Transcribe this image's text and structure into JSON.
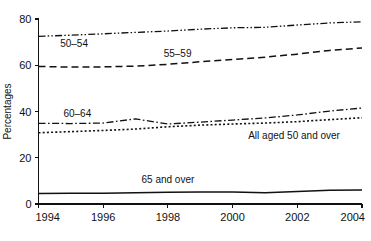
{
  "chart_data": {
    "type": "line",
    "title": "",
    "subtitle": "",
    "xlabel": "",
    "ylabel": "Percentages",
    "xlim": [
      1994,
      2004
    ],
    "ylim": [
      0,
      80
    ],
    "grid": false,
    "legend_position": "inline-labels",
    "x": [
      1994,
      1995,
      1996,
      1997,
      1998,
      1999,
      2000,
      2001,
      2002,
      2003,
      2004
    ],
    "xticks": [
      "1994",
      "1996",
      "1998",
      "2000",
      "2002",
      "2004"
    ],
    "xtick_values": [
      1994,
      1996,
      1998,
      2000,
      2002,
      2004
    ],
    "yticks": [
      "0",
      "20",
      "40",
      "60",
      "80"
    ],
    "ytick_values": [
      0,
      20,
      40,
      60,
      80
    ],
    "series": [
      {
        "name": "50–54",
        "label": "50–54",
        "style": "dash-dot-dot",
        "color": "#111111",
        "values": [
          72.5,
          73.0,
          73.6,
          74.2,
          74.8,
          75.6,
          76.2,
          76.4,
          77.4,
          78.3,
          78.8
        ]
      },
      {
        "name": "55–59",
        "label": "55–59",
        "style": "dashed",
        "color": "#111111",
        "values": [
          59.5,
          59.2,
          59.3,
          59.6,
          60.4,
          61.5,
          62.5,
          63.5,
          64.8,
          66.4,
          67.5
        ]
      },
      {
        "name": "60–64",
        "label": "60–64",
        "style": "dash-dot",
        "color": "#111111",
        "values": [
          34.9,
          34.8,
          35.0,
          36.8,
          34.6,
          35.4,
          36.3,
          37.2,
          38.5,
          40.2,
          41.5
        ]
      },
      {
        "name": "All aged 50 and over",
        "label": "All aged 50 and over",
        "style": "dotted",
        "color": "#111111",
        "values": [
          30.8,
          31.3,
          31.8,
          32.4,
          33.4,
          34.1,
          34.6,
          35.0,
          35.6,
          36.5,
          37.3
        ]
      },
      {
        "name": "65 and over",
        "label": "65 and over",
        "style": "solid",
        "color": "#111111",
        "values": [
          4.5,
          4.6,
          4.7,
          4.9,
          5.1,
          5.2,
          5.2,
          4.9,
          5.4,
          5.9,
          6.1
        ]
      }
    ],
    "annotations": [
      {
        "text": "50–54",
        "x": 1995.1,
        "y": 68.0
      },
      {
        "text": "55–59",
        "x": 1998.3,
        "y": 63.5
      },
      {
        "text": "60–64",
        "x": 1995.2,
        "y": 37.8
      },
      {
        "text": "All aged 50 and over",
        "x": 2001.9,
        "y": 28.2
      },
      {
        "text": "65 and over",
        "x": 1998.0,
        "y": 9.2
      }
    ]
  }
}
